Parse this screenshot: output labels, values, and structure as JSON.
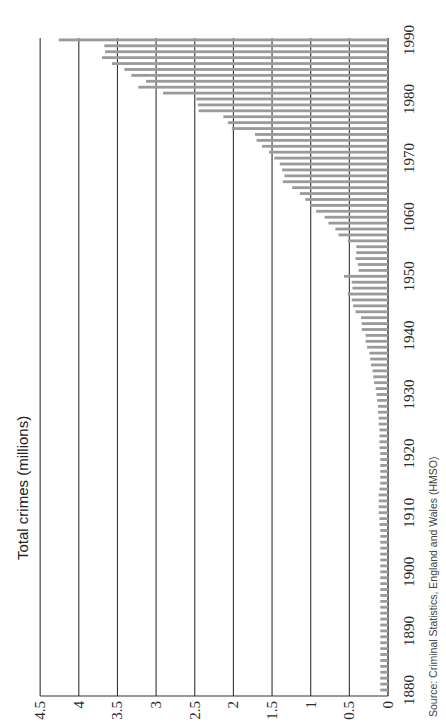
{
  "chart_data": {
    "type": "bar",
    "orientation": "rotated-90-ccw",
    "title": "Total crimes (millions)",
    "xlabel": "",
    "ylabel": "Total crimes (millions)",
    "ylim": [
      0,
      4.5
    ],
    "yticks": [
      "0",
      "0.5",
      "1",
      "1.5",
      "2",
      "2.5",
      "3",
      "3.5",
      "4",
      "4.5"
    ],
    "ytick_values": [
      0,
      0.5,
      1,
      1.5,
      2,
      2.5,
      3,
      3.5,
      4,
      4.5
    ],
    "xticks": [
      "1880",
      "1890",
      "1900",
      "1910",
      "1920",
      "1930",
      "1940",
      "1950",
      "1060",
      "1970",
      "1980",
      "1990"
    ],
    "xtick_years": [
      1880,
      1890,
      1900,
      1910,
      1920,
      1930,
      1940,
      1950,
      1960,
      1970,
      1980,
      1990
    ],
    "grid": true,
    "legend": null,
    "source": "Source: Criminal Statistics, England and Wales (HMSO)",
    "bar_color": "#9a9a9a",
    "grid_color": "#333333",
    "x": [
      1880,
      1881,
      1882,
      1883,
      1884,
      1885,
      1886,
      1887,
      1888,
      1889,
      1890,
      1891,
      1892,
      1893,
      1894,
      1895,
      1896,
      1897,
      1898,
      1899,
      1900,
      1901,
      1902,
      1903,
      1904,
      1905,
      1906,
      1907,
      1908,
      1909,
      1910,
      1911,
      1912,
      1913,
      1914,
      1915,
      1916,
      1917,
      1918,
      1919,
      1920,
      1921,
      1922,
      1923,
      1924,
      1925,
      1926,
      1927,
      1928,
      1929,
      1930,
      1931,
      1932,
      1933,
      1934,
      1935,
      1936,
      1937,
      1938,
      1939,
      1940,
      1941,
      1942,
      1943,
      1944,
      1945,
      1946,
      1947,
      1948,
      1949,
      1950,
      1951,
      1952,
      1953,
      1954,
      1955,
      1956,
      1957,
      1958,
      1959,
      1960,
      1961,
      1962,
      1963,
      1964,
      1965,
      1966,
      1967,
      1968,
      1969,
      1970,
      1971,
      1972,
      1973,
      1974,
      1975,
      1976,
      1977,
      1978,
      1979,
      1980,
      1981,
      1982,
      1983,
      1984,
      1985,
      1986,
      1987,
      1988,
      1989,
      1990
    ],
    "values": [
      0.1,
      0.1,
      0.1,
      0.1,
      0.1,
      0.1,
      0.1,
      0.1,
      0.1,
      0.1,
      0.1,
      0.1,
      0.1,
      0.1,
      0.1,
      0.1,
      0.1,
      0.1,
      0.1,
      0.1,
      0.1,
      0.1,
      0.1,
      0.1,
      0.1,
      0.1,
      0.1,
      0.1,
      0.11,
      0.11,
      0.12,
      0.12,
      0.12,
      0.12,
      0.11,
      0.1,
      0.1,
      0.1,
      0.1,
      0.1,
      0.1,
      0.11,
      0.11,
      0.11,
      0.11,
      0.12,
      0.12,
      0.13,
      0.13,
      0.14,
      0.15,
      0.16,
      0.18,
      0.19,
      0.2,
      0.22,
      0.23,
      0.24,
      0.27,
      0.29,
      0.29,
      0.34,
      0.34,
      0.35,
      0.42,
      0.45,
      0.47,
      0.52,
      0.46,
      0.47,
      0.57,
      0.38,
      0.39,
      0.42,
      0.41,
      0.41,
      0.52,
      0.64,
      0.68,
      0.77,
      0.82,
      0.93,
      1.01,
      1.07,
      1.14,
      1.24,
      1.36,
      1.34,
      1.37,
      1.4,
      1.47,
      1.54,
      1.63,
      1.7,
      1.72,
      2.02,
      2.07,
      2.13,
      2.45,
      2.46,
      2.48,
      2.91,
      3.23,
      3.13,
      3.32,
      3.41,
      3.57,
      3.7,
      3.66,
      3.67,
      4.26
    ]
  }
}
